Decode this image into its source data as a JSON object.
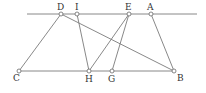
{
  "diagram": {
    "type": "geometry",
    "colors": {
      "line": "#7a7a7a",
      "point_fill": "#ffffff",
      "label": "#333333"
    },
    "top_line": {
      "x1": 27,
      "y1": 14,
      "x2": 197,
      "y2": 14
    },
    "points": {
      "D": {
        "x": 61,
        "y": 14,
        "label": "D"
      },
      "I": {
        "x": 77,
        "y": 14,
        "label": "I"
      },
      "E": {
        "x": 129,
        "y": 14,
        "label": "E"
      },
      "A": {
        "x": 151,
        "y": 14,
        "label": "A"
      },
      "C": {
        "x": 19,
        "y": 71,
        "label": "C"
      },
      "H": {
        "x": 89,
        "y": 71,
        "label": "H"
      },
      "G": {
        "x": 112,
        "y": 71,
        "label": "G"
      },
      "B": {
        "x": 174,
        "y": 71,
        "label": "B"
      }
    },
    "segments": [
      [
        "C",
        "B"
      ],
      [
        "D",
        "C"
      ],
      [
        "D",
        "B"
      ],
      [
        "I",
        "H"
      ],
      [
        "E",
        "H"
      ],
      [
        "E",
        "G"
      ],
      [
        "A",
        "B"
      ]
    ]
  }
}
